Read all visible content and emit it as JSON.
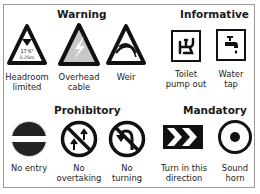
{
  "sections": {
    "warning": {
      "title": "Warning",
      "signs": [
        {
          "name": "Headroom limited",
          "label_line1": "Headroom",
          "label_line2": "limited",
          "inner_text_1": "17'6\"",
          "inner_text_2": "5.25m"
        },
        {
          "name": "Overhead cable",
          "label_line1": "Overhead",
          "label_line2": "cable"
        },
        {
          "name": "Weir",
          "label_line1": "Weir",
          "label_line2": ""
        }
      ]
    },
    "informative": {
      "title": "Informative",
      "signs": [
        {
          "name": "Toilet pump out",
          "label_line1": "Toilet",
          "label_line2": "pump out"
        },
        {
          "name": "Water tap",
          "label_line1": "Water",
          "label_line2": "tap"
        }
      ]
    },
    "prohibitory": {
      "title": "Prohibitory",
      "signs": [
        {
          "name": "No entry",
          "label_line1": "No entry",
          "label_line2": ""
        },
        {
          "name": "No overtaking",
          "label_line1": "No",
          "label_line2": "overtaking"
        },
        {
          "name": "No turning",
          "label_line1": "No",
          "label_line2": "turning"
        }
      ]
    },
    "mandatory": {
      "title": "Mandatory",
      "signs": [
        {
          "name": "Turn in this direction",
          "label_line1": "Turn in this",
          "label_line2": "direction"
        },
        {
          "name": "Sound horn",
          "label_line1": "Sound",
          "label_line2": "horn"
        }
      ]
    }
  },
  "colors": {
    "border": "#9a9a9a",
    "sign_black": "#111111",
    "cable_fill": "#c8c8c8"
  }
}
